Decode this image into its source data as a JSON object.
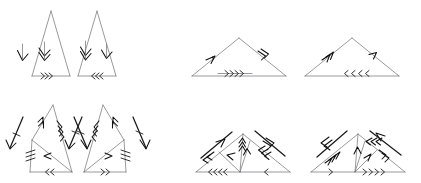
{
  "figure": {
    "background_color": "#ffffff",
    "edge_color": "#6e6e72",
    "marker_color": "#111111",
    "vector_color": "#1a1a1a",
    "width": 421,
    "height": 183,
    "rows": 2,
    "columns": 4,
    "panel_count": 8
  },
  "panels": [
    {
      "id": "panel-1",
      "row": 1,
      "column": 1,
      "shape": "tall-isoceles-triangle",
      "apex": "top",
      "label": "",
      "edges": [
        {
          "name": "left-side",
          "markers": 1,
          "direction": "down-left",
          "style": "chevron"
        },
        {
          "name": "right-side",
          "markers": 2,
          "direction": "down-right",
          "style": "chevron"
        },
        {
          "name": "base",
          "markers": 3,
          "direction": "right",
          "style": "chevron"
        }
      ],
      "internal_lines": 0,
      "external_vectors": 0
    },
    {
      "id": "panel-2",
      "row": 1,
      "column": 2,
      "shape": "tall-isoceles-triangle",
      "apex": "top",
      "label": "",
      "edges": [
        {
          "name": "left-side",
          "markers": 2,
          "direction": "down-left",
          "style": "chevron"
        },
        {
          "name": "right-side",
          "markers": 1,
          "direction": "down-right",
          "style": "chevron"
        },
        {
          "name": "base",
          "markers": 3,
          "direction": "left",
          "style": "chevron"
        }
      ],
      "internal_lines": 0,
      "external_vectors": 0
    },
    {
      "id": "panel-3",
      "row": 1,
      "column": 3,
      "shape": "wide-flat-triangle",
      "apex": "top",
      "label": "",
      "edges": [
        {
          "name": "left-side",
          "markers": 1,
          "direction": "up-right",
          "style": "arrowhead"
        },
        {
          "name": "right-side",
          "markers": 2,
          "direction": "down-right",
          "style": "chevron"
        },
        {
          "name": "base",
          "markers": 4,
          "direction": "right",
          "style": "chevron"
        }
      ],
      "internal_lines": 0,
      "external_vectors": 0
    },
    {
      "id": "panel-4",
      "row": 1,
      "column": 4,
      "shape": "wide-flat-triangle",
      "apex": "top",
      "label": "",
      "edges": [
        {
          "name": "left-side",
          "markers": 2,
          "direction": "up-right",
          "style": "chevron"
        },
        {
          "name": "right-side",
          "markers": 1,
          "direction": "down-right",
          "style": "arrowhead"
        },
        {
          "name": "base",
          "markers": 4,
          "direction": "left",
          "style": "chevron"
        }
      ],
      "internal_lines": 0,
      "external_vectors": 0
    },
    {
      "id": "panel-5",
      "row": 2,
      "column": 1,
      "shape": "tall-triangle-with-cevian",
      "apex": "top",
      "label": "",
      "edges": [
        {
          "name": "left-upper-side",
          "markers": 2,
          "direction": "down-left",
          "style": "chevron"
        },
        {
          "name": "right-side",
          "markers": 3,
          "direction": "down-right",
          "style": "chevron"
        },
        {
          "name": "cevian",
          "markers": 1,
          "direction": "left",
          "style": "arrowhead"
        },
        {
          "name": "left-lower-side",
          "markers": 3,
          "direction": "down",
          "style": "chevron"
        },
        {
          "name": "base",
          "markers": 2,
          "direction": "left",
          "style": "chevron"
        }
      ],
      "internal_lines": 1,
      "external_vectors": [
        {
          "name": "left-external-vector",
          "direction": "down-left",
          "markers": 1
        },
        {
          "name": "right-external-vector",
          "direction": "down-right",
          "markers": 1
        }
      ]
    },
    {
      "id": "panel-6",
      "row": 2,
      "column": 2,
      "shape": "tall-triangle-with-cevian",
      "apex": "top",
      "label": "",
      "edges": [
        {
          "name": "left-side",
          "markers": 3,
          "direction": "down-left",
          "style": "chevron"
        },
        {
          "name": "right-upper-side",
          "markers": 2,
          "direction": "down-right",
          "style": "chevron"
        },
        {
          "name": "cevian",
          "markers": 1,
          "direction": "right",
          "style": "arrowhead"
        },
        {
          "name": "right-lower-side",
          "markers": 3,
          "direction": "down",
          "style": "chevron"
        },
        {
          "name": "base",
          "markers": 2,
          "direction": "right",
          "style": "chevron"
        }
      ],
      "internal_lines": 1,
      "external_vectors": [
        {
          "name": "left-external-vector",
          "direction": "down-left",
          "markers": 1
        },
        {
          "name": "right-external-vector",
          "direction": "down-right",
          "markers": 1
        }
      ]
    },
    {
      "id": "panel-7",
      "row": 2,
      "column": 3,
      "shape": "wide-triangle-with-two-cevians",
      "apex": "top",
      "label": "",
      "edges": [
        {
          "name": "left-side",
          "markers": 2,
          "direction": "down-left",
          "style": "chevron"
        },
        {
          "name": "left-cevian",
          "markers": 3,
          "direction": "up",
          "style": "chevron"
        },
        {
          "name": "right-cevian",
          "markers": 1,
          "direction": "up",
          "style": "arrowhead"
        },
        {
          "name": "mid-cevian",
          "markers": 1,
          "direction": "left",
          "style": "arrowhead"
        },
        {
          "name": "right-side",
          "markers": 3,
          "direction": "down-left",
          "style": "chevron"
        },
        {
          "name": "base-left",
          "markers": 4,
          "direction": "left",
          "style": "chevron"
        },
        {
          "name": "base-right",
          "markers": 1,
          "direction": "left",
          "style": "chevron"
        }
      ],
      "internal_lines": 3,
      "external_vectors": [
        {
          "name": "left-external-vector",
          "direction": "up-right",
          "markers": 1
        },
        {
          "name": "right-external-vector",
          "direction": "down-right",
          "markers": 2
        }
      ]
    },
    {
      "id": "panel-8",
      "row": 2,
      "column": 4,
      "shape": "wide-triangle-with-two-cevians",
      "apex": "top",
      "label": "",
      "edges": [
        {
          "name": "left-side",
          "markers": 3,
          "direction": "up-right",
          "style": "chevron"
        },
        {
          "name": "left-cevian",
          "markers": 1,
          "direction": "up",
          "style": "arrowhead"
        },
        {
          "name": "mid-cevian",
          "markers": 1,
          "direction": "up-right",
          "style": "arrowhead"
        },
        {
          "name": "right-cevian",
          "markers": 3,
          "direction": "left",
          "style": "chevron"
        },
        {
          "name": "right-side",
          "markers": 2,
          "direction": "down-right",
          "style": "chevron"
        },
        {
          "name": "base-left",
          "markers": 1,
          "direction": "right",
          "style": "chevron"
        },
        {
          "name": "base-right",
          "markers": 4,
          "direction": "right",
          "style": "chevron"
        }
      ],
      "internal_lines": 3,
      "external_vectors": [
        {
          "name": "left-external-vector",
          "direction": "down-left",
          "markers": 1
        },
        {
          "name": "right-external-vector",
          "direction": "down-left",
          "markers": 1
        }
      ]
    }
  ]
}
